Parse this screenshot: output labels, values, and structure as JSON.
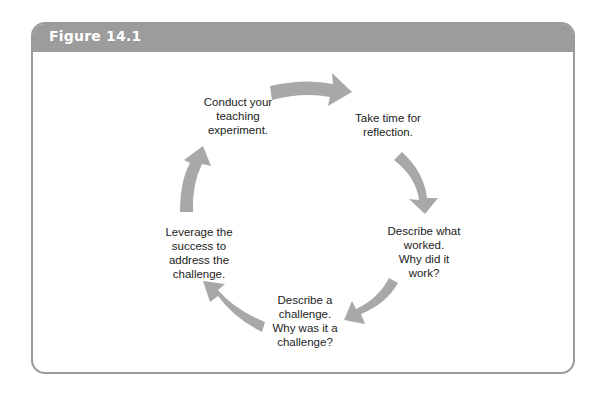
{
  "figure": {
    "title": "Figure 14.1",
    "colors": {
      "header_bg": "#9c9c9c",
      "header_text": "#ffffff",
      "border": "#9a9a9a",
      "arrow": "#a8a8a8",
      "text": "#222222"
    }
  },
  "cycle": {
    "nodes": [
      {
        "id": "conduct",
        "label": "Conduct your\nteaching\nexperiment."
      },
      {
        "id": "reflect",
        "label": "Take time for\nreflection."
      },
      {
        "id": "worked",
        "label": "Describe what\nworked.\nWhy did it\nwork?"
      },
      {
        "id": "challenge",
        "label": "Describe a\nchallenge.\nWhy was it a\nchallenge?"
      },
      {
        "id": "leverage",
        "label": "Leverage the\nsuccess to\naddress the\nchallenge."
      }
    ],
    "arrows": [
      {
        "from": "conduct",
        "to": "reflect"
      },
      {
        "from": "reflect",
        "to": "worked"
      },
      {
        "from": "worked",
        "to": "challenge"
      },
      {
        "from": "challenge",
        "to": "leverage"
      },
      {
        "from": "leverage",
        "to": "conduct"
      }
    ]
  }
}
